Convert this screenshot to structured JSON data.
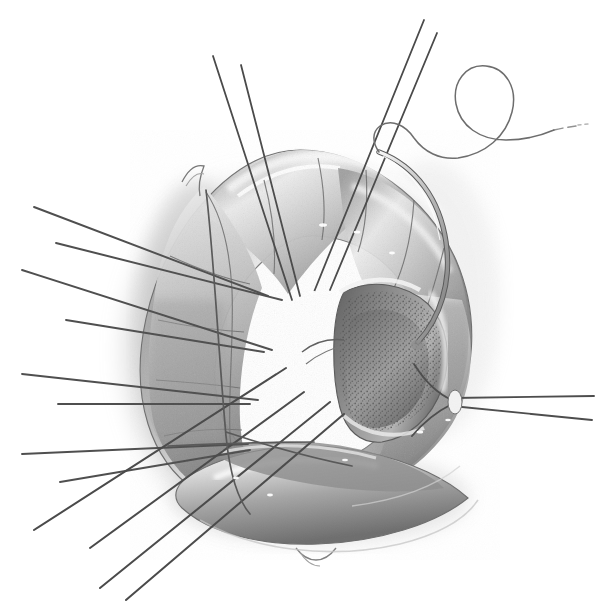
{
  "figure": {
    "domain": "Natural-Image",
    "medium": "pencil-and-stipple medical illustration",
    "subject": "aortic valve annulus with implanted sewing ring, radiating pledgeted sutures, and a curved surgical needle carrying a looping suture thread",
    "orientation": "surgeon's view looking down into the valve orifice",
    "background_color": "#ffffff",
    "ink_color": "#4a4a4a",
    "midtone_color": "#9a9a9a",
    "shadow_color": "#6b6b6b",
    "highlight_color": "#f6f6f6",
    "stipple_color": "#5d5d5d",
    "has_text_labels": false,
    "text_labels": [],
    "elements": [
      {
        "name": "annulus-ring",
        "description": "thick rounded triangular tube forming the valve annulus / sewing ring, occupying the centre of the frame",
        "tone": "light gray with rolled highlights"
      },
      {
        "name": "valve-orifice",
        "description": "open white lumen at the centre, roughly circular",
        "tone": "paper white"
      },
      {
        "name": "leaflet-tissue",
        "description": "darker stippled leaflet / cusp tissue on the right inner wall of the orifice",
        "tone": "mid to dark gray stipple"
      },
      {
        "name": "suture-fan-left",
        "description": "fan of eight straight suture strands radiating out to the left edge of the frame",
        "count": 8
      },
      {
        "name": "suture-fan-lower-left",
        "description": "fan of four long suture strands running to the lower-left corner",
        "count": 4
      },
      {
        "name": "suture-pair-right",
        "description": "pair of nearly horizontal suture strands exiting the right edge",
        "count": 2
      },
      {
        "name": "suture-pair-top",
        "description": "two long suture strands rising to the top edge of the frame, left pair",
        "count": 2
      },
      {
        "name": "suture-pair-top-right",
        "description": "two long suture strands rising to the top-right of the frame",
        "count": 2
      },
      {
        "name": "curved-needle",
        "description": "curved surgical needle passing through the annulus wall on the upper right",
        "tone": "bright metal with dark outline"
      },
      {
        "name": "suture-thread-loop",
        "description": "free suture thread leaving the needle, making a large open loop in the upper-right corner and trailing off the right edge",
        "tone": "fine gray line"
      },
      {
        "name": "drop-shadow",
        "description": "soft graphite shadow cast to the left and below the annulus",
        "tone": "soft gray wash"
      }
    ]
  }
}
